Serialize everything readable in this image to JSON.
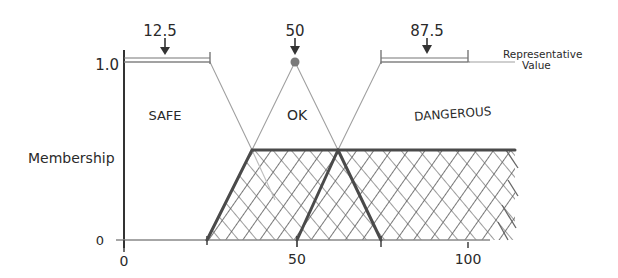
{
  "diagram": {
    "type": "fuzzy-membership-defuzzification",
    "y_axis": {
      "label": "Membership",
      "ticks": [
        "1.0",
        "0"
      ]
    },
    "x_axis": {
      "ticks": [
        "0",
        "50",
        "100"
      ]
    },
    "sets": [
      {
        "name": "SAFE",
        "representative_value": "12.5"
      },
      {
        "name": "OK",
        "representative_value": "50"
      },
      {
        "name": "DANGEROUS",
        "representative_value": "87.5"
      }
    ],
    "annotation": {
      "line1": "Representative",
      "line2": "Value"
    },
    "colors": {
      "axis": "#333333",
      "thin_line": "#9a9a9a",
      "bold_line": "#4a4a4a",
      "hatch": "#555555",
      "peak_dot": "#7a7a7a"
    }
  }
}
